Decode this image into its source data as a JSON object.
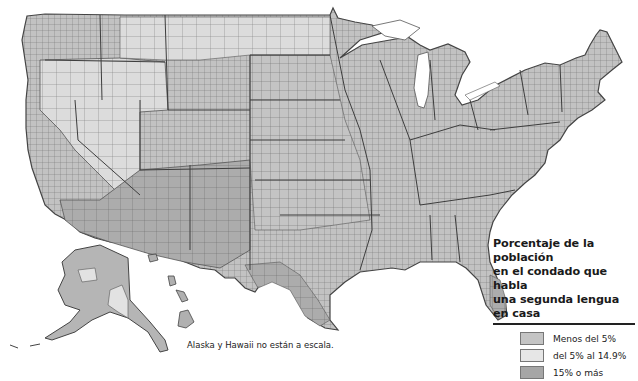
{
  "map": {
    "title_fragment": "…g…",
    "subject": "United States counties",
    "fill_colors": {
      "low": "#c4c4c4",
      "mid": "#e6e6e6",
      "high": "#a6a6a6",
      "border": "#666666",
      "state_border": "#444444"
    }
  },
  "legend": {
    "title_lines": [
      "Porcentaje de la población",
      "en el condado que habla",
      "una segunda lengua en casa"
    ],
    "items": [
      {
        "label": "Menos del 5%",
        "color": "#c4c4c4"
      },
      {
        "label": "del 5% al 14.9%",
        "color": "#e6e6e6"
      },
      {
        "label": "15% o más",
        "color": "#a6a6a6"
      }
    ]
  },
  "caption": "Alaska y Hawaii no están a escala."
}
